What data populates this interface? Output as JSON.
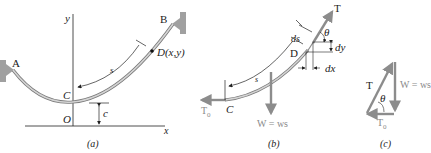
{
  "figure": {
    "panels": [
      {
        "id": "a",
        "caption": "(a)",
        "labels": {
          "y_axis": "y",
          "x_axis": "x",
          "origin": "O",
          "lowest_point": "C",
          "support_left": "A",
          "support_right": "B",
          "point_d": "D(x,y)",
          "arc_length": "s",
          "offset": "c"
        }
      },
      {
        "id": "b",
        "caption": "(b)",
        "labels": {
          "tension": "T",
          "horizontal_tension": "T",
          "horizontal_tension_sub": "0",
          "angle": "θ",
          "ds": "ds",
          "dy": "dy",
          "dx": "dx",
          "point_d": "D",
          "point_c": "C",
          "arc_length": "s",
          "weight": "W = ws"
        }
      },
      {
        "id": "c",
        "caption": "(c)",
        "labels": {
          "tension": "T",
          "angle": "θ",
          "horizontal_tension": "T",
          "horizontal_tension_sub": "0",
          "weight": "W = ws"
        }
      }
    ],
    "colors": {
      "cable": "#b8b8b8",
      "cable_edge": "#7a7a7a",
      "force_arrow": "#8c8c8c",
      "line": "#222222",
      "support": "#9a9a9a"
    }
  }
}
